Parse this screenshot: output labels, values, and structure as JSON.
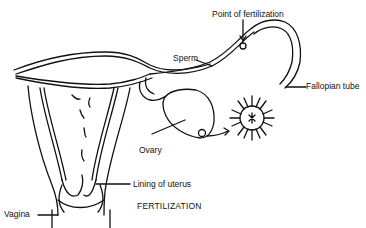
{
  "diagram": {
    "title": "FERTILIZATION",
    "labels": {
      "point_of_fertilization": "Point of fertilization",
      "sperm": "Sperm",
      "fallopian_tube": "Fallopian tube",
      "ovary": "Ovary",
      "lining_of_uterus": "Lining of uterus",
      "vagina": "Vagina"
    },
    "colors": {
      "ink": "#111111",
      "background": "#ffffff"
    }
  }
}
